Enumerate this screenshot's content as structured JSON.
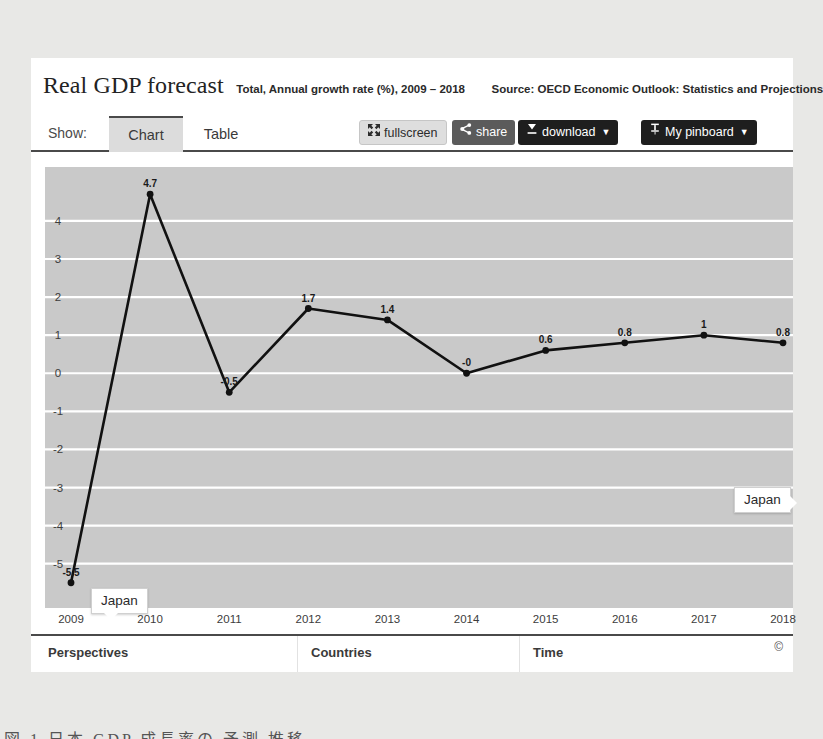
{
  "header": {
    "title": "Real GDP forecast",
    "subtitle": "Total, Annual growth rate (%), 2009 – 2018",
    "source": "Source: OECD Economic Outlook: Statistics and Projections"
  },
  "toolbar": {
    "show_label": "Show:",
    "tabs": [
      {
        "label": "Chart",
        "active": true
      },
      {
        "label": "Table",
        "active": false
      }
    ],
    "buttons": [
      {
        "id": "fullscreen",
        "label": "fullscreen",
        "icon": "expand-arrows-icon",
        "caret": ""
      },
      {
        "id": "share",
        "label": "share",
        "icon": "share-icon",
        "caret": ""
      },
      {
        "id": "download",
        "label": "download",
        "icon": "download-icon",
        "caret": "▼"
      },
      {
        "id": "pinboard",
        "label": "My pinboard",
        "icon": "pin-icon",
        "caret": "▼"
      }
    ]
  },
  "tooltips": [
    {
      "label": "Japan",
      "position": "left-lower"
    },
    {
      "label": "Japan",
      "position": "right-end"
    }
  ],
  "footer": {
    "perspectives": "Perspectives",
    "countries": "Countries",
    "time": "Time",
    "copyright": "©"
  },
  "bottom_strip": "図 1 日本 GDP 成長率の 予測 推移",
  "colors": {
    "plot_background": "#c9c9c9",
    "gridline": "#ffffff",
    "series_line": "#111111",
    "accent_dark": "#1e1e1e",
    "card_background": "#ffffff"
  },
  "chart_data": {
    "type": "line",
    "title": "Real GDP forecast",
    "subtitle": "Total, Annual growth rate (%), 2009 – 2018",
    "source": "Source: OECD Economic Outlook: Statistics and Projections",
    "xlabel": "Time",
    "ylabel": "",
    "x": [
      2009,
      2010,
      2011,
      2012,
      2013,
      2014,
      2015,
      2016,
      2017,
      2018
    ],
    "categories": [
      "2009",
      "2010",
      "2011",
      "2012",
      "2013",
      "2014",
      "2015",
      "2016",
      "2017",
      "2018"
    ],
    "series": [
      {
        "name": "Japan",
        "values": [
          -5.5,
          4.7,
          -0.5,
          1.7,
          1.4,
          -0.0,
          0.6,
          0.8,
          1.0,
          0.8
        ],
        "point_labels": [
          "-5.5",
          "4.7",
          "-0.5",
          "1.7",
          "1.4",
          "-0",
          "0.6",
          "0.8",
          "1",
          "0.8"
        ]
      }
    ],
    "ylim": [
      -5.9,
      5.1
    ],
    "yticks": [
      4,
      3,
      2,
      1,
      0,
      -1,
      -2,
      -3,
      -4,
      -5
    ],
    "ytick_labels": [
      "4",
      "3",
      "2",
      "1",
      "0",
      "-1",
      "-2",
      "-3",
      "-4",
      "-5"
    ],
    "grid": true,
    "legend": "none"
  }
}
